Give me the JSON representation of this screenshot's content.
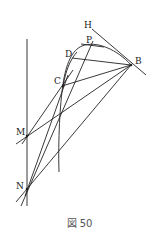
{
  "figure": {
    "caption": "図 50",
    "points": [
      {
        "id": "H",
        "label": "H"
      },
      {
        "id": "P",
        "label": "P"
      },
      {
        "id": "D",
        "label": "D"
      },
      {
        "id": "C",
        "label": "C"
      },
      {
        "id": "B",
        "label": "B"
      },
      {
        "id": "M",
        "label": "M"
      },
      {
        "id": "N",
        "label": "N"
      }
    ],
    "segments": [
      [
        "H",
        "B"
      ],
      [
        "B",
        "D"
      ],
      [
        "B",
        "C"
      ],
      [
        "B",
        "M"
      ],
      [
        "B",
        "N"
      ],
      [
        "M",
        "C"
      ],
      [
        "N",
        "C"
      ],
      [
        "N",
        "P"
      ],
      [
        "M",
        "N"
      ]
    ],
    "curves": [
      {
        "name": "arc-through-P-D-C",
        "through": [
          "P",
          "D",
          "C"
        ]
      }
    ]
  }
}
